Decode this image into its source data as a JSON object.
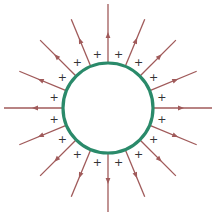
{
  "diagram": {
    "title": "",
    "center": [
      108,
      108
    ],
    "sphere": {
      "radius": 45,
      "stroke_color": "#2a8a6a",
      "stroke_width": 3.2,
      "fill": "#ffffff"
    },
    "field_lines": {
      "count": 16,
      "color": "#a05a5a",
      "stroke_width": 1.3,
      "inner_radius": 46,
      "outer_radius_axis": 104,
      "outer_radius_diag": 96,
      "arrow_radius": 73,
      "direction": "outward"
    },
    "charges": {
      "symbol": "+",
      "count": 16,
      "radius": 55,
      "angle_offset_deg": 11.25,
      "color": "#333333"
    }
  }
}
